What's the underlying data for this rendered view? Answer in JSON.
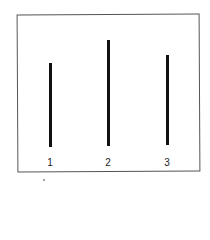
{
  "figure": {
    "lines": [
      {
        "label": "1",
        "x": 50,
        "top": 63,
        "bottom": 147,
        "relative_length": 84
      },
      {
        "label": "2",
        "x": 108,
        "top": 40,
        "bottom": 146,
        "relative_length": 106
      },
      {
        "label": "3",
        "x": 167,
        "top": 55,
        "bottom": 145,
        "relative_length": 90
      }
    ],
    "colors": {
      "line": "#111111",
      "frame": "#555555",
      "background": "#ffffff"
    }
  }
}
